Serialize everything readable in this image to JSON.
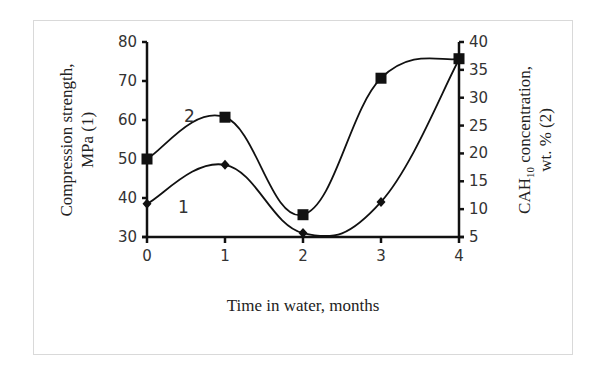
{
  "chart_data": {
    "type": "line",
    "title": "",
    "xlabel": "Time in water, months",
    "ylabel_left_line1": "Compression strength,",
    "ylabel_left_line2": "MPa (1)",
    "ylabel_right_line1_pre": "CAH",
    "ylabel_right_line1_sub": "10",
    "ylabel_right_line1_post": " concentration,",
    "ylabel_right_line2": "wt. % (2)",
    "x": [
      0,
      1,
      2,
      3,
      4
    ],
    "x_tick_labels": [
      "0",
      "1",
      "2",
      "3",
      "4"
    ],
    "ylim_left": [
      30,
      80
    ],
    "y_left_ticks": [
      "30",
      "40",
      "50",
      "60",
      "70",
      "80"
    ],
    "ylim_right": [
      5,
      40
    ],
    "y_right_ticks": [
      "5",
      "10",
      "15",
      "20",
      "25",
      "30",
      "35",
      "40"
    ],
    "grid": false,
    "smooth": true,
    "series": [
      {
        "name": "1",
        "label": "1",
        "axis": "left",
        "marker": "diamond",
        "values": [
          38.5,
          48.5,
          31,
          39,
          75.5
        ]
      },
      {
        "name": "2",
        "label": "2",
        "axis": "right",
        "marker": "square",
        "values": [
          19,
          26.5,
          9,
          33.5,
          37
        ]
      }
    ]
  }
}
